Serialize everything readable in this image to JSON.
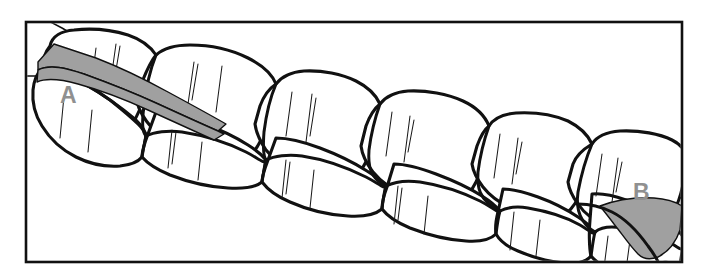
{
  "figure": {
    "kind": "geologic-block-diagram",
    "background_color": "#ffffff",
    "frame": {
      "name": "diagram-frame",
      "stroke_color": "#111111",
      "x": 26,
      "y": 22,
      "width": 656,
      "height": 240
    },
    "outline_color": "#111111",
    "block_fill_color": "#ffffff",
    "hatch_color": "#1a1a1a",
    "gray_fill_color": "#a0a0a0",
    "label_color": "#909090"
  },
  "labels": {
    "a": {
      "text": "A",
      "x": 60,
      "y": 95,
      "color": "#909090",
      "description": "upper-left tapering gray wedge"
    },
    "b": {
      "text": "B",
      "x": 635,
      "y": 194,
      "color": "#909090",
      "description": "lower-right gray lens"
    }
  },
  "features": [
    {
      "id": "feature-a",
      "label": "A",
      "fill": "#a0a0a0",
      "shape": "tapering-wedge",
      "position": "upper-left"
    },
    {
      "id": "feature-b",
      "label": "B",
      "fill": "#a0a0a0",
      "shape": "crescent-lens",
      "position": "lower-right"
    }
  ],
  "blocks": {
    "count": 12,
    "rows": 2,
    "columns": 6,
    "description": "diagonal chain of rounded rectangular joint blocks descending left to right"
  }
}
